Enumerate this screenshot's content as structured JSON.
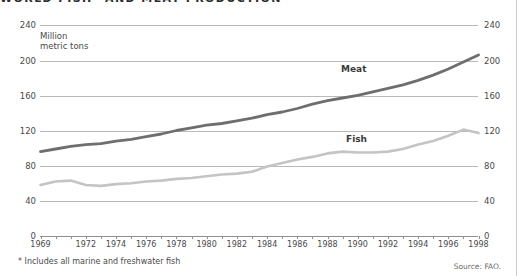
{
  "title": "WORLD FISH* AND MEAT PRODUCTION",
  "unit_label": "Million\nmetric tons",
  "footnote": "* Includes all marine and freshwater fish",
  "source": "Source: FAO.",
  "colors": {
    "meat": "#6e6e6e",
    "fish": "#c4c4c4",
    "grid": "#b9b9b9",
    "axis": "#8f8f8f",
    "text": "#4a4a4a"
  },
  "axes": {
    "y_ticks": [
      240,
      200,
      160,
      120,
      80,
      40,
      0
    ],
    "y_ticks_right": [
      240,
      200,
      160,
      120,
      80,
      40,
      0
    ],
    "ylim": [
      0,
      240
    ],
    "x_tick_labels": [
      "1969",
      "1972",
      "1974",
      "1976",
      "1978",
      "1980",
      "1982",
      "1984",
      "1986",
      "1988",
      "1990",
      "1992",
      "1994",
      "1996",
      "1998"
    ],
    "xlim": [
      1969,
      1998
    ]
  },
  "series_labels": {
    "meat": "Meat",
    "fish": "Fish"
  },
  "chart_data": {
    "type": "line",
    "title": "WORLD FISH* AND MEAT PRODUCTION",
    "xlabel": "",
    "ylabel": "Million metric tons",
    "ylim": [
      0,
      240
    ],
    "grid": true,
    "legend": "inline-labels",
    "x": [
      1969,
      1970,
      1971,
      1972,
      1973,
      1974,
      1975,
      1976,
      1977,
      1978,
      1979,
      1980,
      1981,
      1982,
      1983,
      1984,
      1985,
      1986,
      1987,
      1988,
      1989,
      1990,
      1991,
      1992,
      1993,
      1994,
      1995,
      1996,
      1997,
      1998
    ],
    "series": [
      {
        "name": "Meat",
        "color": "#6e6e6e",
        "values": [
          96,
          99,
          102,
          104,
          105,
          108,
          110,
          113,
          116,
          120,
          123,
          126,
          128,
          131,
          134,
          138,
          141,
          145,
          150,
          154,
          157,
          160,
          164,
          168,
          172,
          177,
          183,
          190,
          198,
          206
        ]
      },
      {
        "name": "Fish",
        "color": "#c4c4c4",
        "values": [
          58,
          62,
          63,
          58,
          57,
          59,
          60,
          62,
          63,
          65,
          66,
          68,
          70,
          71,
          73,
          79,
          83,
          87,
          90,
          94,
          96,
          95,
          95,
          96,
          99,
          104,
          108,
          114,
          121,
          117
        ]
      }
    ]
  }
}
